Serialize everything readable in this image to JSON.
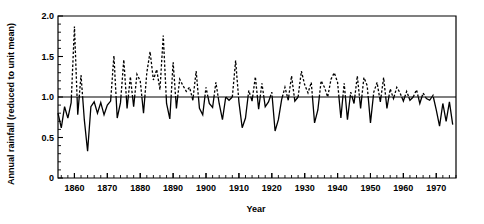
{
  "chart_data": {
    "type": "line",
    "title": "",
    "xlabel": "Year",
    "ylabel": "Annual rainfall (reduced to unit mean)",
    "xlim": [
      1855,
      1976
    ],
    "ylim": [
      0,
      2.0
    ],
    "grid": false,
    "legend": null,
    "reference_line": {
      "y": 1.0,
      "label": "unit mean"
    },
    "style_note": "Segments above the unit-mean line are drawn dashed; segments below are drawn solid.",
    "y_ticks_major": [
      "0",
      "0.5",
      "1.0",
      "1.5",
      "2.0"
    ],
    "y_tick_values": [
      0,
      0.5,
      1.0,
      1.5,
      2.0
    ],
    "y_minor_tick_step": 0.1,
    "x_ticks_major": [
      "1860",
      "1870",
      "1880",
      "1890",
      "1900",
      "1910",
      "1920",
      "1930",
      "1940",
      "1950",
      "1960",
      "1970"
    ],
    "x_tick_values": [
      1860,
      1870,
      1880,
      1890,
      1900,
      1910,
      1920,
      1930,
      1940,
      1950,
      1960,
      1970
    ],
    "x_minor_tick_step": 2,
    "x": [
      1855,
      1856,
      1857,
      1858,
      1859,
      1860,
      1861,
      1862,
      1863,
      1864,
      1865,
      1866,
      1867,
      1868,
      1869,
      1870,
      1871,
      1872,
      1873,
      1874,
      1875,
      1876,
      1877,
      1878,
      1879,
      1880,
      1881,
      1882,
      1883,
      1884,
      1885,
      1886,
      1887,
      1888,
      1889,
      1890,
      1891,
      1892,
      1893,
      1894,
      1895,
      1896,
      1897,
      1898,
      1899,
      1900,
      1901,
      1902,
      1903,
      1904,
      1905,
      1906,
      1907,
      1908,
      1909,
      1910,
      1911,
      1912,
      1913,
      1914,
      1915,
      1916,
      1917,
      1918,
      1919,
      1920,
      1921,
      1922,
      1923,
      1924,
      1925,
      1926,
      1927,
      1928,
      1929,
      1930,
      1931,
      1932,
      1933,
      1934,
      1935,
      1936,
      1937,
      1938,
      1939,
      1940,
      1941,
      1942,
      1943,
      1944,
      1945,
      1946,
      1947,
      1948,
      1949,
      1950,
      1951,
      1952,
      1953,
      1954,
      1955,
      1956,
      1957,
      1958,
      1959,
      1960,
      1961,
      1962,
      1963,
      1964,
      1965,
      1966,
      1967,
      1968,
      1969,
      1970,
      1971,
      1972,
      1973,
      1974,
      1975
    ],
    "values": [
      0.8,
      0.62,
      0.88,
      0.74,
      0.93,
      1.87,
      0.78,
      1.27,
      0.72,
      0.33,
      0.88,
      0.94,
      0.8,
      0.93,
      0.78,
      0.9,
      0.95,
      1.51,
      0.74,
      0.93,
      1.46,
      0.86,
      1.25,
      0.88,
      1.28,
      1.2,
      0.8,
      1.3,
      1.56,
      1.21,
      1.34,
      1.09,
      1.76,
      0.92,
      0.73,
      1.43,
      0.86,
      1.22,
      1.14,
      1.07,
      1.12,
      0.96,
      1.32,
      0.86,
      0.78,
      1.12,
      0.92,
      0.87,
      1.18,
      0.92,
      0.72,
      1.0,
      0.96,
      1.0,
      1.45,
      0.94,
      0.62,
      0.74,
      1.08,
      0.95,
      1.25,
      0.85,
      1.17,
      0.88,
      0.94,
      1.06,
      0.58,
      0.72,
      0.97,
      1.12,
      0.96,
      1.26,
      0.95,
      1.0,
      1.32,
      1.15,
      1.05,
      1.18,
      0.68,
      0.84,
      1.2,
      1.12,
      1.0,
      1.22,
      1.3,
      1.18,
      0.74,
      1.17,
      0.72,
      1.06,
      0.92,
      1.26,
      0.86,
      1.24,
      1.14,
      0.68,
      1.06,
      1.18,
      0.94,
      1.24,
      0.86,
      1.1,
      0.98,
      1.12,
      1.05,
      0.95,
      1.07,
      0.96,
      1.0,
      1.09,
      0.92,
      1.05,
      0.98,
      0.96,
      1.02,
      0.84,
      0.64,
      0.92,
      0.7,
      0.94,
      0.66
    ]
  },
  "axis": {
    "x_label": "Year",
    "y_label": "Annual rainfall (reduced to unit mean)"
  }
}
